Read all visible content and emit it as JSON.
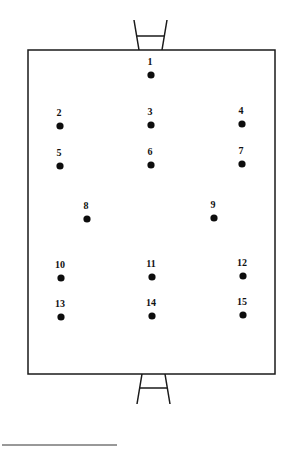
{
  "diagram": {
    "type": "rugby-field-positions",
    "field": {
      "x1": 28,
      "y1": 50,
      "x2": 275,
      "y2": 374
    },
    "colors": {
      "line": "#1a1a1a",
      "dot": "#0d0d0d",
      "background": "#ffffff"
    },
    "positions": [
      {
        "label": "1",
        "x": 151,
        "y": 75
      },
      {
        "label": "2",
        "x": 60,
        "y": 126
      },
      {
        "label": "3",
        "x": 151,
        "y": 125
      },
      {
        "label": "4",
        "x": 242,
        "y": 124
      },
      {
        "label": "5",
        "x": 60,
        "y": 166
      },
      {
        "label": "6",
        "x": 151,
        "y": 165
      },
      {
        "label": "7",
        "x": 242,
        "y": 164
      },
      {
        "label": "8",
        "x": 87,
        "y": 219
      },
      {
        "label": "9",
        "x": 214,
        "y": 218
      },
      {
        "label": "10",
        "x": 61,
        "y": 278
      },
      {
        "label": "11",
        "x": 152,
        "y": 277
      },
      {
        "label": "12",
        "x": 243,
        "y": 276
      },
      {
        "label": "13",
        "x": 61,
        "y": 317
      },
      {
        "label": "14",
        "x": 152,
        "y": 316
      },
      {
        "label": "15",
        "x": 243,
        "y": 315
      }
    ]
  }
}
